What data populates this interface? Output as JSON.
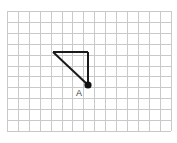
{
  "figure": {
    "type": "geometry-diagram",
    "canvas": {
      "width": 177,
      "height": 143,
      "background": "#ffffff"
    },
    "grid": {
      "visible": true,
      "origin_x": 7,
      "origin_y": 11,
      "cell_size": 10.9,
      "columns": 15,
      "rows": 11,
      "line_color": "#c9c9c9",
      "line_width": 1
    },
    "shape": {
      "name": "right-triangle",
      "stroke_color": "#1a1a1a",
      "stroke_width": 2,
      "closed": true,
      "vertices": [
        {
          "id": "top-left",
          "label": "",
          "x": 53,
          "y": 52,
          "grid_col": 4.2,
          "grid_row": 3.8
        },
        {
          "id": "top-right",
          "label": "",
          "x": 88,
          "y": 52,
          "grid_col": 7.4,
          "grid_row": 3.8
        },
        {
          "id": "A",
          "label": "A",
          "x": 88,
          "y": 85,
          "grid_col": 7.4,
          "grid_row": 6.8
        }
      ],
      "edges": [
        {
          "id": "top-horizontal",
          "from": "top-left",
          "to": "top-right"
        },
        {
          "id": "right-vertical",
          "from": "top-right",
          "to": "A"
        },
        {
          "id": "hypotenuse",
          "from": "A",
          "to": "top-left"
        }
      ]
    },
    "markers": [
      {
        "id": "point-A",
        "label": "A",
        "x": 88,
        "y": 85,
        "radius": 3.6,
        "color": "#111111",
        "label_x": 79,
        "label_y": 96,
        "label_color": "#3a3a3a",
        "label_size": 9
      }
    ]
  }
}
